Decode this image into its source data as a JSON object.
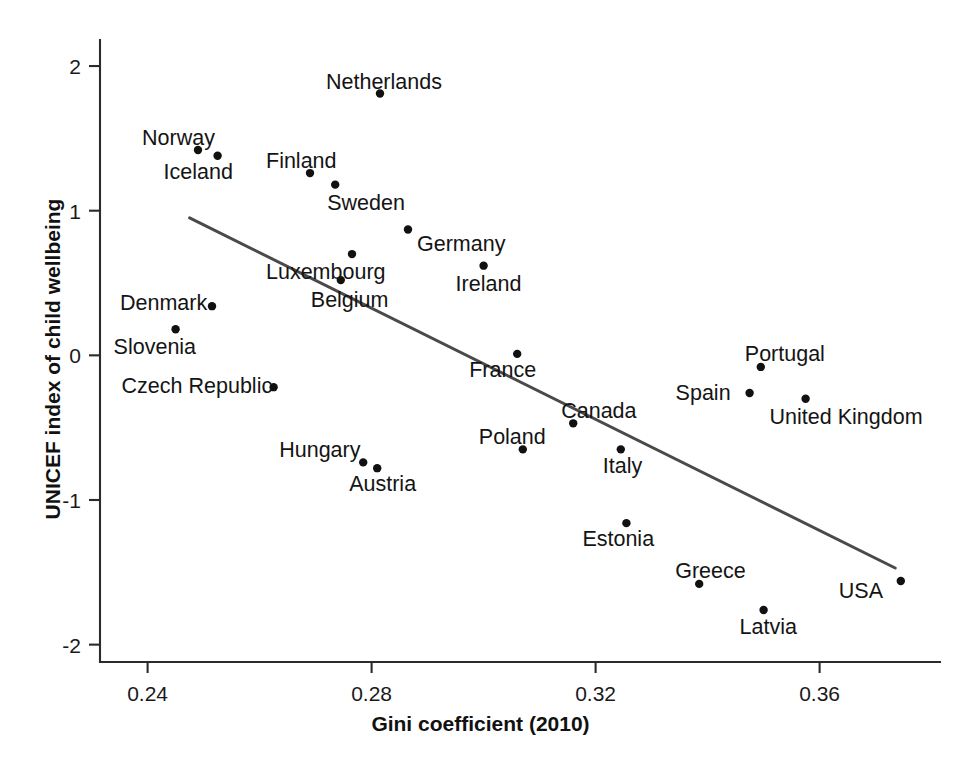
{
  "chart_data": {
    "type": "scatter",
    "title": "",
    "xlabel": "Gini coefficient (2010)",
    "ylabel": "UNICEF index of child wellbeing",
    "xlim": [
      0.2315,
      0.3815
    ],
    "ylim": [
      -2.12,
      2.18
    ],
    "xticks": [
      0.24,
      0.28,
      0.32,
      0.36
    ],
    "xtick_labels": [
      "0.24",
      "0.28",
      "0.32",
      "0.36"
    ],
    "yticks": [
      2,
      1,
      0,
      -1,
      -2
    ],
    "ytick_labels": [
      "2",
      "1",
      "0",
      "-1",
      "-2"
    ],
    "grid": false,
    "legend": "none",
    "point_color": "#111111",
    "trend_color": "#4a4a4a",
    "axis_color": "#2b2b2b",
    "trend_line": {
      "type": "linear-fit",
      "x_start": 0.2475,
      "y_start": 0.95,
      "x_end": 0.3735,
      "y_end": -1.47
    },
    "points": [
      {
        "name": "Netherlands",
        "x": 0.2815,
        "y": 1.81,
        "label_dx": -54,
        "label_dy": -22
      },
      {
        "name": "Norway",
        "x": 0.249,
        "y": 1.42,
        "label_dx": -56,
        "label_dy": -22
      },
      {
        "name": "Iceland",
        "x": 0.2525,
        "y": 1.38,
        "label_dx": -54,
        "label_dy": 6
      },
      {
        "name": "Finland",
        "x": 0.269,
        "y": 1.26,
        "label_dx": -44,
        "label_dy": -22
      },
      {
        "name": "Sweden",
        "x": 0.2735,
        "y": 1.18,
        "label_dx": -8,
        "label_dy": 8
      },
      {
        "name": "Germany",
        "x": 0.2865,
        "y": 0.87,
        "label_dx": 9,
        "label_dy": 5
      },
      {
        "name": "Luxembourg",
        "x": 0.2765,
        "y": 0.7,
        "label_dx": -86,
        "label_dy": 8
      },
      {
        "name": "Ireland",
        "x": 0.3,
        "y": 0.62,
        "label_dx": -28,
        "label_dy": 8
      },
      {
        "name": "Belgium",
        "x": 0.2745,
        "y": 0.52,
        "label_dx": -30,
        "label_dy": 10
      },
      {
        "name": "Denmark",
        "x": 0.2515,
        "y": 0.34,
        "label_dx": -92,
        "label_dy": -13
      },
      {
        "name": "Slovenia",
        "x": 0.245,
        "y": 0.18,
        "label_dx": -62,
        "label_dy": 8
      },
      {
        "name": "France",
        "x": 0.306,
        "y": 0.01,
        "label_dx": -48,
        "label_dy": 6
      },
      {
        "name": "Czech Republic",
        "x": 0.2625,
        "y": -0.22,
        "label_dx": -152,
        "label_dy": -11
      },
      {
        "name": "Portugal",
        "x": 0.3495,
        "y": -0.08,
        "label_dx": -16,
        "label_dy": -23
      },
      {
        "name": "Spain",
        "x": 0.3475,
        "y": -0.26,
        "label_dx": -74,
        "label_dy": -10
      },
      {
        "name": "United Kingdom",
        "x": 0.3575,
        "y": -0.3,
        "label_dx": -36,
        "label_dy": 8
      },
      {
        "name": "Canada",
        "x": 0.316,
        "y": -0.47,
        "label_dx": -12,
        "label_dy": -22
      },
      {
        "name": "Poland",
        "x": 0.307,
        "y": -0.65,
        "label_dx": -44,
        "label_dy": -22
      },
      {
        "name": "Italy",
        "x": 0.3245,
        "y": -0.65,
        "label_dx": -18,
        "label_dy": 7
      },
      {
        "name": "Hungary",
        "x": 0.2785,
        "y": -0.74,
        "label_dx": -84,
        "label_dy": -22
      },
      {
        "name": "Austria",
        "x": 0.281,
        "y": -0.78,
        "label_dx": -28,
        "label_dy": 6
      },
      {
        "name": "Estonia",
        "x": 0.3255,
        "y": -1.16,
        "label_dx": -44,
        "label_dy": 6
      },
      {
        "name": "Greece",
        "x": 0.3385,
        "y": -1.58,
        "label_dx": -24,
        "label_dy": -23
      },
      {
        "name": "Latvia",
        "x": 0.35,
        "y": -1.76,
        "label_dx": -24,
        "label_dy": 7
      },
      {
        "name": "USA",
        "x": 0.3745,
        "y": -1.56,
        "label_dx": -62,
        "label_dy": 0
      }
    ]
  }
}
